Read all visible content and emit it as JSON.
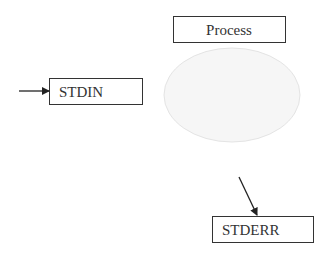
{
  "diagram": {
    "process": {
      "label": "Process"
    },
    "stdin": {
      "label": "STDIN"
    },
    "stderr": {
      "label": "STDERR"
    }
  },
  "colors": {
    "stroke": "#333333",
    "ellipse_fill": "#f7f7f7",
    "ellipse_stroke": "#e6e6e6"
  }
}
